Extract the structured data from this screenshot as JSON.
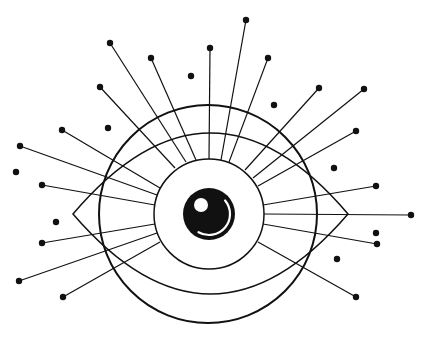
{
  "illustration": {
    "title": "Eye with radiating lashes",
    "colors": {
      "ink": "#111111",
      "background": "#ffffff"
    },
    "outer_circle": {
      "cx": 208,
      "cy": 214,
      "r": 109
    },
    "eye_shape": {
      "left_x": 73,
      "right_x": 348,
      "mid_y": 214,
      "top_y": 133,
      "bottom_y": 294
    },
    "iris": {
      "cx": 209,
      "cy": 214,
      "r": 55
    },
    "pupil": {
      "cx": 209,
      "cy": 214,
      "r": 26
    },
    "highlight": {
      "cx": 201,
      "cy": 205,
      "r": 7
    },
    "rays": [
      {
        "x1": 186,
        "y1": 162,
        "x2": 110,
        "y2": 43
      },
      {
        "x1": 196,
        "y1": 160,
        "x2": 151,
        "y2": 58
      },
      {
        "x1": 209,
        "y1": 159,
        "x2": 210,
        "y2": 48
      },
      {
        "x1": 221,
        "y1": 160,
        "x2": 246,
        "y2": 20
      },
      {
        "x1": 229,
        "y1": 162,
        "x2": 268,
        "y2": 58
      },
      {
        "x1": 175,
        "y1": 168,
        "x2": 100,
        "y2": 87
      },
      {
        "x1": 245,
        "y1": 170,
        "x2": 319,
        "y2": 88
      },
      {
        "x1": 253,
        "y1": 178,
        "x2": 364,
        "y2": 89
      },
      {
        "x1": 160,
        "y1": 188,
        "x2": 62,
        "y2": 130
      },
      {
        "x1": 258,
        "y1": 186,
        "x2": 356,
        "y2": 131
      },
      {
        "x1": 157,
        "y1": 195,
        "x2": 20,
        "y2": 146
      },
      {
        "x1": 155,
        "y1": 205,
        "x2": 42,
        "y2": 185
      },
      {
        "x1": 263,
        "y1": 205,
        "x2": 376,
        "y2": 186
      },
      {
        "x1": 264,
        "y1": 214,
        "x2": 411,
        "y2": 215
      },
      {
        "x1": 263,
        "y1": 224,
        "x2": 377,
        "y2": 244
      },
      {
        "x1": 155,
        "y1": 224,
        "x2": 42,
        "y2": 243
      },
      {
        "x1": 157,
        "y1": 233,
        "x2": 19,
        "y2": 281
      },
      {
        "x1": 160,
        "y1": 242,
        "x2": 63,
        "y2": 297
      },
      {
        "x1": 258,
        "y1": 242,
        "x2": 356,
        "y2": 297
      }
    ],
    "loose_dots": [
      {
        "cx": 191,
        "cy": 76
      },
      {
        "cx": 108,
        "cy": 128
      },
      {
        "cx": 274,
        "cy": 105
      },
      {
        "cx": 16,
        "cy": 172
      },
      {
        "cx": 334,
        "cy": 168
      },
      {
        "cx": 56,
        "cy": 222
      },
      {
        "cx": 376,
        "cy": 233
      },
      {
        "cx": 337,
        "cy": 259
      }
    ]
  }
}
